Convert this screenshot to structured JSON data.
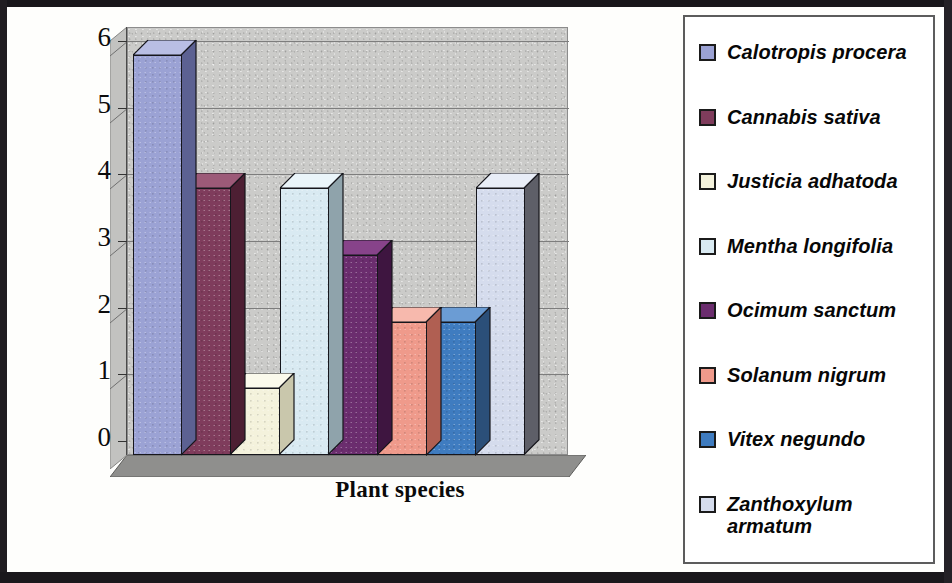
{
  "chart_data": {
    "type": "bar",
    "title": "",
    "xlabel": "Plant species",
    "ylabel": "No. of families",
    "categories": [
      "Calotropis procera",
      "Cannabis sativa",
      "Justicia adhatoda",
      "Mentha longifolia",
      "Ocimum sanctum",
      "Solanum nigrum",
      "Vitex negundo",
      "Zanthoxylum armatum"
    ],
    "values": [
      6,
      4,
      1,
      4,
      3,
      2,
      2,
      4
    ],
    "ylim": [
      0,
      6
    ],
    "yticks": [
      "0",
      "1",
      "2",
      "3",
      "4",
      "5",
      "6"
    ],
    "xticks": [],
    "grid": true,
    "legend_position": "right",
    "style": "3d-column",
    "series": [
      {
        "name": "No. of families",
        "values": [
          6,
          4,
          1,
          4,
          3,
          2,
          2,
          4
        ]
      }
    ]
  },
  "axes": {
    "y_title": "No. of families",
    "x_title": "Plant species",
    "y_tick_labels": [
      "6",
      "5",
      "4",
      "3",
      "2",
      "1",
      "0"
    ]
  },
  "legend": {
    "items": [
      {
        "label": "Calotropis procera",
        "color": "#9ba2d4",
        "side": "#5c6192",
        "top": "#b9bee4"
      },
      {
        "label": "Cannabis sativa",
        "color": "#7f3c5c",
        "side": "#4d1f33",
        "top": "#9c5a78"
      },
      {
        "label": "Justicia adhatoda",
        "color": "#f4f2dc",
        "side": "#c9c7ac",
        "top": "#fbfaec"
      },
      {
        "label": "Mentha longifolia",
        "color": "#d9eaf2",
        "side": "#8fa3ab",
        "top": "#eaf5fa"
      },
      {
        "label": "Ocimum sanctum",
        "color": "#6b2d6e",
        "side": "#3e1540",
        "top": "#87438a"
      },
      {
        "label": "Solanum nigrum",
        "color": "#ef9a8b",
        "side": "#b05f52",
        "top": "#f7b9ad"
      },
      {
        "label": "Vitex negundo",
        "color": "#3f7cc0",
        "side": "#2b4f79",
        "top": "#6b9cd4"
      },
      {
        "label": "Zanthoxylum\narmatum",
        "color": "#d5dced",
        "side": "#5e5f68",
        "top": "#e8edf7"
      }
    ]
  },
  "colors": {
    "background": "#fefefc",
    "wall": "#cbcbc9",
    "floor": "#8f8f8d",
    "gridline": "#7d7d7d",
    "border": "#18161a"
  }
}
